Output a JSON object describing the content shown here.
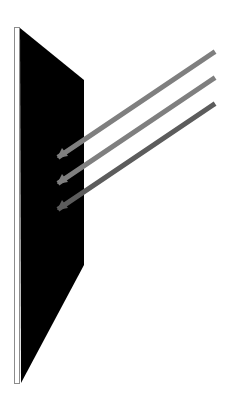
{
  "diagram": {
    "width": 232,
    "height": 405,
    "background": "#ffffff",
    "panel_edge": {
      "x": 14.5,
      "y": 27.5,
      "width": 5,
      "height": 356,
      "fill": "#ffffff",
      "stroke": "#8c8c8c"
    },
    "panel_face": {
      "points": "20,28 84,80 84,265 21,383",
      "fill": "#000000"
    },
    "arrows": [
      {
        "x1": 213,
        "y1": 53,
        "x2": 60,
        "y2": 156,
        "color": "#7f7f7f",
        "width": 5,
        "head": "57,158 62,148 68,156"
      },
      {
        "x1": 213,
        "y1": 79,
        "x2": 60,
        "y2": 182,
        "color": "#7f7f7f",
        "width": 5,
        "head": "57,184 62,174 68,182"
      },
      {
        "x1": 213,
        "y1": 105,
        "x2": 60,
        "y2": 208,
        "color": "#5c5c5c",
        "width": 5,
        "head": "57,210 62,200 68,208"
      }
    ]
  }
}
